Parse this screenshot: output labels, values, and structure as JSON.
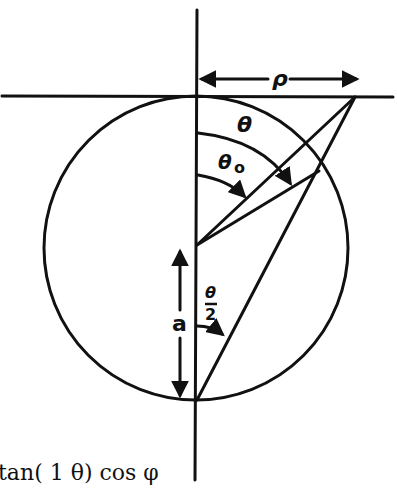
{
  "diagram": {
    "labels": {
      "rho": "ρ",
      "theta": "θ",
      "theta0_main": "θ",
      "theta0_sub": "o",
      "half_theta_num": "θ",
      "half_theta_den": "2",
      "a": "a"
    },
    "equation_fragment": "tan( 1 θ) cos φ",
    "colors": {
      "ink": "#111111",
      "background": "#ffffff"
    }
  }
}
